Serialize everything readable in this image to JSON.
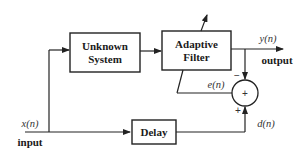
{
  "diagram": {
    "blocks": {
      "unknown_system": {
        "line1": "Unknown",
        "line2": "System"
      },
      "adaptive_filter": {
        "line1": "Adaptive",
        "line2": "Filter"
      },
      "delay": {
        "label": "Delay"
      },
      "summer": {
        "symbol": "+"
      }
    },
    "signals": {
      "input_symbol": "x(n)",
      "input_label": "input",
      "output_symbol": "y(n)",
      "output_label": "output",
      "error_symbol": "e(n)",
      "desired_symbol": "d(n)"
    },
    "signs": {
      "minus": "−",
      "plus": "+"
    },
    "colors": {
      "line": "#222222",
      "text": "#1a1a1a"
    }
  }
}
